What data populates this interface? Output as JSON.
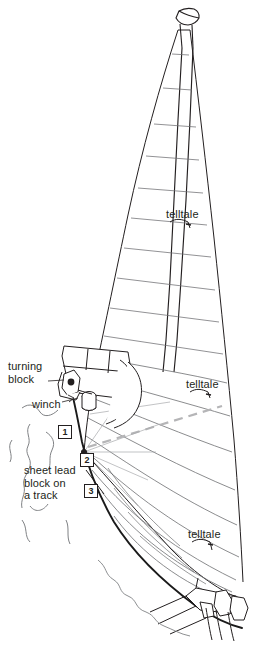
{
  "figure": {
    "kind": "sailboat-rig-diagram",
    "background_color": "#ffffff",
    "line_color": "#231f20",
    "sail_seam_color": "#6d6e71",
    "dashed_guide_color": "#b5b5b7",
    "sheet_line_color": "#1a1a1a"
  },
  "labels": {
    "turning_block": "turning\nblock",
    "winch": "winch",
    "sheet_lead": "sheet lead\nblock on\na track",
    "telltale_upper": "telltale",
    "telltale_middle": "telltale",
    "telltale_lower": "telltale"
  },
  "callouts": [
    {
      "number": "1",
      "x": 58,
      "y": 425
    },
    {
      "number": "2",
      "x": 80,
      "y": 453
    },
    {
      "number": "3",
      "x": 84,
      "y": 484
    }
  ],
  "telltales": [
    {
      "label": "telltale",
      "x": 166,
      "y": 208
    },
    {
      "label": "telltale",
      "x": 186,
      "y": 378
    },
    {
      "label": "telltale",
      "x": 188,
      "y": 528
    }
  ],
  "text_blocks": [
    {
      "id": "turning-block",
      "text": "turning\nblock",
      "x": 8,
      "y": 362
    },
    {
      "id": "winch",
      "text": "winch",
      "x": 32,
      "y": 400
    },
    {
      "id": "sheet-lead",
      "text": "sheet lead\nblock on\na track",
      "x": 24,
      "y": 466
    }
  ]
}
